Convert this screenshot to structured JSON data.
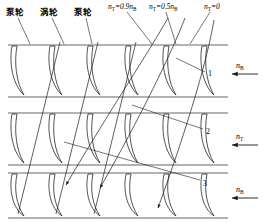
{
  "figure": {
    "stroke_color": "#1a1a1a",
    "boundary_color": "#555555",
    "background": "#ffffff"
  },
  "wheel_labels": [
    {
      "id": "pump-1",
      "text": "泵轮",
      "x": 6,
      "y": 14
    },
    {
      "id": "turbine-1",
      "text": "涡轮",
      "x": 40,
      "y": 14
    },
    {
      "id": "pump-2",
      "text": "泵轮",
      "x": 74,
      "y": 14
    }
  ],
  "speed_ratio_labels": [
    {
      "id": "ratio-09",
      "lead": "n",
      "sub1": "T",
      "rel": "=0.9",
      "tail": "n",
      "sub2": "B",
      "x": 108,
      "y": 3
    },
    {
      "id": "ratio-05",
      "lead": "n",
      "sub1": "T",
      "rel": "=0.5",
      "tail": "n",
      "sub2": "B",
      "x": 149,
      "y": 3
    },
    {
      "id": "ratio-00",
      "lead": "n",
      "sub1": "T",
      "rel": "=0",
      "tail": "",
      "sub2": "",
      "x": 204,
      "y": 3
    }
  ],
  "callout_numbers": [
    {
      "id": "callout-1",
      "text": "1",
      "x": 208,
      "y": 70
    },
    {
      "id": "callout-2",
      "text": "2",
      "x": 206,
      "y": 128
    },
    {
      "id": "callout-3",
      "text": "3",
      "x": 203,
      "y": 180
    }
  ],
  "rotation_arrows": [
    {
      "id": "arrow-nB-top",
      "lead": "n",
      "sub": "B",
      "label_x": 236,
      "label_y": 62,
      "arrow_y": 74
    },
    {
      "id": "arrow-nT-middle",
      "lead": "n",
      "sub": "T",
      "label_x": 236,
      "label_y": 133,
      "arrow_y": 145
    },
    {
      "id": "arrow-nB-bottom",
      "lead": "n",
      "sub": "B",
      "label_x": 236,
      "label_y": 186,
      "arrow_y": 198
    }
  ],
  "rows": [
    {
      "id": "row-pump-upper",
      "top": 45,
      "bottom": 97,
      "blade_count": 6
    },
    {
      "id": "row-turbine",
      "top": 113,
      "bottom": 165,
      "blade_count": 6
    },
    {
      "id": "row-pump-lower",
      "top": 173,
      "bottom": 218,
      "blade_count": 6
    }
  ]
}
